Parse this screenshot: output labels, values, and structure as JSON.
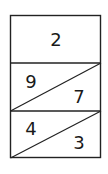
{
  "diagram": {
    "type": "fraction-box",
    "border_color": "#222222",
    "top_cell": {
      "value": "2"
    },
    "rows": [
      {
        "upper_left": "9",
        "lower_right": "7"
      },
      {
        "upper_left": "4",
        "lower_right": "3"
      }
    ]
  }
}
